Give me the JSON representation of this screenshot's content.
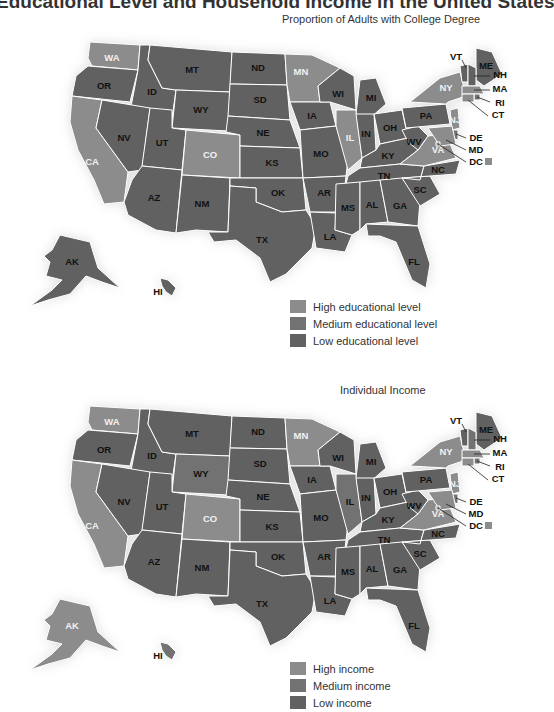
{
  "page_title": "Educational Level and Household Income in the United States",
  "colors": {
    "high": "#8c8c8c",
    "medium": "#727272",
    "low": "#616161",
    "label_dark": "#111111",
    "label_light": "#f2f2f2"
  },
  "maps": [
    {
      "title": "Proportion of Adults with College Degree",
      "legend": [
        {
          "level": "high",
          "label": "High educational level"
        },
        {
          "level": "medium",
          "label": "Medium educational level"
        },
        {
          "level": "low",
          "label": "Low educational level"
        }
      ],
      "states": {
        "WA": "high",
        "OR": "low",
        "CA": "high",
        "ID": "low",
        "NV": "low",
        "MT": "low",
        "WY": "low",
        "UT": "low",
        "CO": "high",
        "AZ": "low",
        "NM": "low",
        "ND": "low",
        "SD": "low",
        "NE": "low",
        "KS": "low",
        "OK": "low",
        "TX": "low",
        "MN": "high",
        "IA": "low",
        "MO": "low",
        "AR": "low",
        "LA": "low",
        "WI": "low",
        "IL": "high",
        "MI": "low",
        "IN": "low",
        "OH": "low",
        "KY": "low",
        "TN": "low",
        "MS": "low",
        "AL": "low",
        "GA": "low",
        "FL": "low",
        "SC": "low",
        "NC": "low",
        "VA": "high",
        "WV": "low",
        "PA": "low",
        "NY": "high",
        "VT": "low",
        "ME": "low",
        "NH": "low",
        "MA": "high",
        "RI": "medium",
        "CT": "high",
        "NJ": "high",
        "DE": "medium",
        "MD": "high",
        "DC": "high",
        "AK": "low",
        "HI": "low"
      }
    },
    {
      "title": "Individual Income",
      "legend": [
        {
          "level": "high",
          "label": "High income"
        },
        {
          "level": "medium",
          "label": "Medium income"
        },
        {
          "level": "low",
          "label": "Low income"
        }
      ],
      "states": {
        "WA": "high",
        "OR": "low",
        "CA": "high",
        "ID": "low",
        "NV": "low",
        "MT": "low",
        "WY": "medium",
        "UT": "low",
        "CO": "high",
        "AZ": "low",
        "NM": "low",
        "ND": "low",
        "SD": "low",
        "NE": "low",
        "KS": "low",
        "OK": "low",
        "TX": "low",
        "MN": "high",
        "IA": "low",
        "MO": "low",
        "AR": "low",
        "LA": "low",
        "WI": "low",
        "IL": "medium",
        "MI": "low",
        "IN": "low",
        "OH": "low",
        "KY": "low",
        "TN": "low",
        "MS": "low",
        "AL": "low",
        "GA": "low",
        "FL": "low",
        "SC": "low",
        "NC": "low",
        "VA": "high",
        "WV": "low",
        "PA": "low",
        "NY": "high",
        "VT": "low",
        "ME": "low",
        "NH": "medium",
        "MA": "high",
        "RI": "medium",
        "CT": "high",
        "NJ": "high",
        "DE": "medium",
        "MD": "high",
        "DC": "high",
        "AK": "high",
        "HI": "medium"
      }
    }
  ],
  "state_labels": {
    "WA": "WA",
    "OR": "OR",
    "CA": "CA",
    "ID": "ID",
    "NV": "NV",
    "MT": "MT",
    "WY": "WY",
    "UT": "UT",
    "CO": "CO",
    "AZ": "AZ",
    "NM": "NM",
    "ND": "ND",
    "SD": "SD",
    "NE": "NE",
    "KS": "KS",
    "OK": "OK",
    "TX": "TX",
    "MN": "MN",
    "IA": "IA",
    "MO": "MO",
    "AR": "AR",
    "LA": "LA",
    "WI": "WI",
    "IL": "IL",
    "MI": "MI",
    "IN": "IN",
    "OH": "OH",
    "KY": "KY",
    "TN": "TN",
    "MS": "MS",
    "AL": "AL",
    "GA": "GA",
    "FL": "FL",
    "SC": "SC",
    "NC": "NC",
    "VA": "VA",
    "WV": "WV",
    "PA": "PA",
    "NY": "NY",
    "VT": "VT",
    "ME": "ME",
    "NH": "NH",
    "MA": "MA",
    "RI": "RI",
    "CT": "CT",
    "NJ": "NJ",
    "DE": "DE",
    "MD": "MD",
    "DC": "DC",
    "AK": "AK",
    "HI": "HI"
  }
}
